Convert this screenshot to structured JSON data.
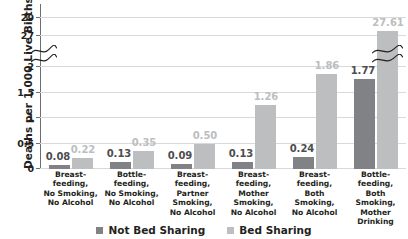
{
  "chart_data": {
    "type": "bar",
    "title": "",
    "xlabel": "",
    "ylabel": "Deaths per 1,000 Live Births",
    "categories": [
      "Breast-feeding, No Smoking, No Alcohol",
      "Bottle-feeding, No Smoking, No Alcohol",
      "Breast-feeding, Partner Smoking, No Alcohol",
      "Breast-feeding, Mother Smoking, No Alcohol",
      "Breast-feeding, Both Smoking, No Alcohol",
      "Bottle-feeding, Both Smoking, Mother Drinking"
    ],
    "category_lines": [
      [
        "Breast-",
        "feeding,",
        "No Smoking,",
        "No Alcohol"
      ],
      [
        "Bottle-",
        "feeding,",
        "No Smoking,",
        "No Alcohol"
      ],
      [
        "Breast-",
        "feeding,",
        "Partner",
        "Smoking,",
        "No Alcohol"
      ],
      [
        "Breast-",
        "feeding,",
        "Mother",
        "Smoking,",
        "No Alcohol"
      ],
      [
        "Breast-",
        "feeding,",
        "Both",
        "Smoking,",
        "No Alcohol"
      ],
      [
        "Bottle-",
        "feeding,",
        "Both",
        "Smoking,",
        "Mother",
        "Drinking"
      ]
    ],
    "series": [
      {
        "name": "Not Bed Sharing",
        "color": "#808285",
        "values": [
          0.08,
          0.13,
          0.09,
          0.13,
          0.24,
          1.77
        ],
        "labels": [
          "0.08",
          "0.13",
          "0.09",
          "0.13",
          "0.24",
          "1.77"
        ]
      },
      {
        "name": "Bed Sharing",
        "color": "#bcbec0",
        "values": [
          0.22,
          0.35,
          0.5,
          1.26,
          1.86,
          27.61
        ],
        "labels": [
          "0.22",
          "0.35",
          "0.50",
          "1.26",
          "1.86",
          "27.61"
        ]
      }
    ],
    "yticks_lower": [
      "0",
      "0.5",
      "1",
      "1.5",
      "2"
    ],
    "yticks_upper": [
      "27",
      "29"
    ],
    "ylim_lower": [
      0,
      2
    ],
    "ylim_upper": [
      26,
      30
    ],
    "axis_break": true,
    "grid": true,
    "legend_position": "bottom"
  },
  "legend": {
    "items": [
      {
        "label": "Not Bed Sharing",
        "color": "#808285"
      },
      {
        "label": "Bed Sharing",
        "color": "#bcbec0"
      }
    ]
  },
  "colors": {
    "not_bed_sharing": "#808285",
    "bed_sharing": "#bcbec0",
    "grid": "#d9d9d9",
    "axis": "#6d6e71",
    "text": "#231f20"
  }
}
